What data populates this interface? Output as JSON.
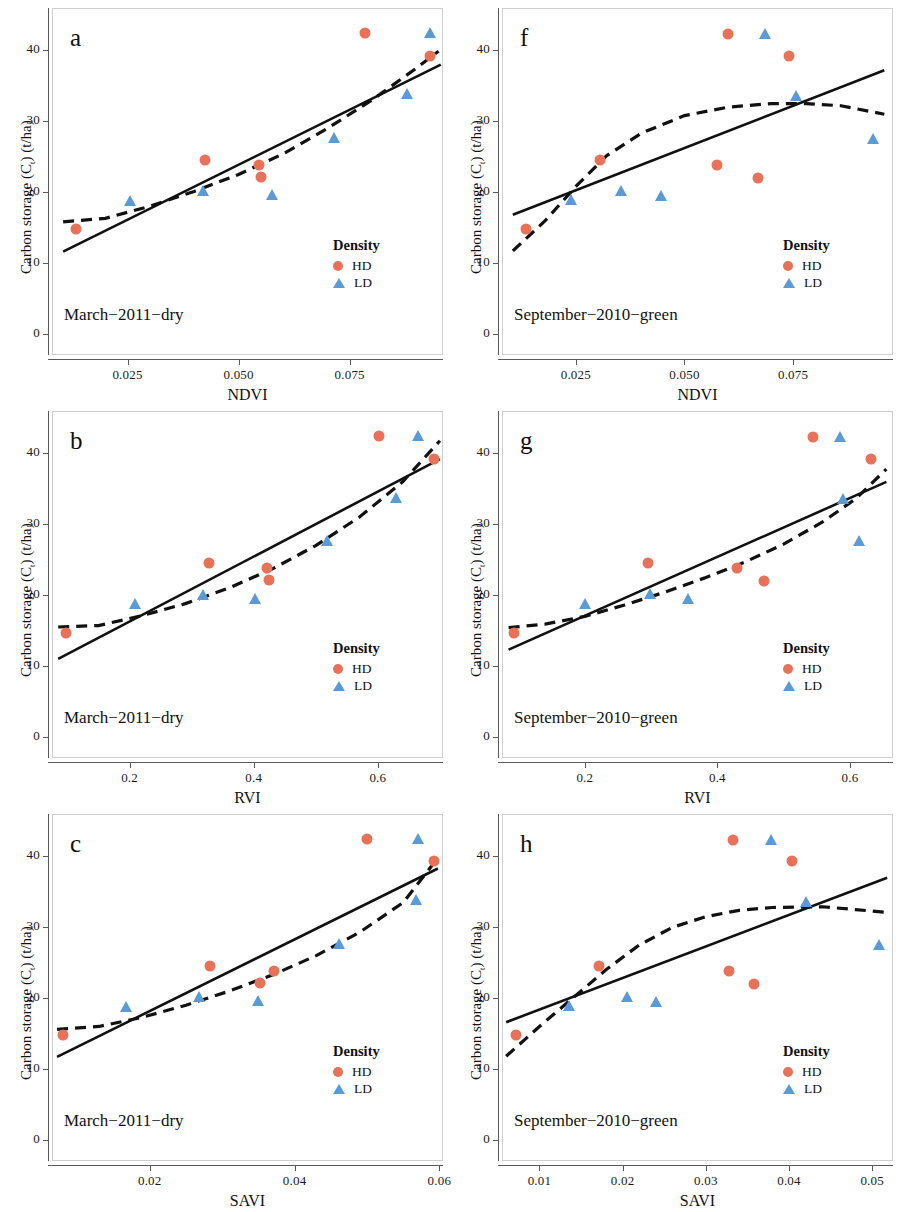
{
  "figure": {
    "y_axis_title": "Carbon storage (Cₜ) (t/ha)",
    "legend_title": "Density",
    "legend_entries": [
      {
        "key": "HD",
        "label": "HD",
        "marker": "circle",
        "color": "#E8715A"
      },
      {
        "key": "LD",
        "label": "LD",
        "marker": "triangle",
        "color": "#5B9BD5"
      }
    ],
    "colors": {
      "hd_marker": "#E8715A",
      "ld_marker": "#5B9BD5",
      "linear_fit": "#111111",
      "poly_fit": "#111111",
      "frame": "#cfcfcf",
      "axis": "#5a5a5a",
      "background": "#ffffff"
    },
    "fit_styles": {
      "linear": "solid",
      "polynomial": "dashed"
    }
  },
  "chart_data": [
    {
      "panel": "a",
      "type": "scatter",
      "title": "",
      "subtitle": "March−2011−dry",
      "xlabel": "NDVI",
      "ylabel": "Carbon storage (Cₜ) (t/ha)",
      "xlim": [
        0.008,
        0.096
      ],
      "ylim": [
        -3,
        46
      ],
      "xticks": [
        0.025,
        0.05,
        0.075
      ],
      "xtick_labels": [
        "0.025",
        "0.050",
        "0.075"
      ],
      "yticks": [
        0,
        10,
        20,
        30,
        40
      ],
      "ytick_labels": [
        "0",
        "10",
        "20",
        "30",
        "40"
      ],
      "grid": false,
      "legend_position": "bottom-right",
      "series": [
        {
          "name": "HD",
          "marker": "circle",
          "color": "#E8715A",
          "points": [
            [
              0.0135,
              14.8
            ],
            [
              0.0425,
              24.6
            ],
            [
              0.0545,
              23.9
            ],
            [
              0.055,
              22.1
            ],
            [
              0.0785,
              42.4
            ],
            [
              0.093,
              39.2
            ]
          ]
        },
        {
          "name": "LD",
          "marker": "triangle",
          "color": "#5B9BD5",
          "points": [
            [
              0.0255,
              18.1
            ],
            [
              0.042,
              19.4
            ],
            [
              0.0575,
              18.9
            ],
            [
              0.0715,
              26.9
            ],
            [
              0.088,
              33.1
            ],
            [
              0.093,
              41.7
            ]
          ]
        }
      ],
      "fits": [
        {
          "name": "linear",
          "style": "solid",
          "points": [
            [
              0.0105,
              11.6
            ],
            [
              0.0955,
              38.0
            ]
          ]
        },
        {
          "name": "polynomial",
          "style": "dashed",
          "points": [
            [
              0.0105,
              15.8
            ],
            [
              0.02,
              16.3
            ],
            [
              0.03,
              18.0
            ],
            [
              0.04,
              20.1
            ],
            [
              0.05,
              22.5
            ],
            [
              0.06,
              25.4
            ],
            [
              0.07,
              29.0
            ],
            [
              0.08,
              33.0
            ],
            [
              0.09,
              37.5
            ],
            [
              0.095,
              39.9
            ]
          ]
        }
      ]
    },
    {
      "panel": "f",
      "type": "scatter",
      "title": "",
      "subtitle": "September−2010−green",
      "xlabel": "NDVI",
      "ylabel": "Carbon storage (Cₜ) (t/ha)",
      "xlim": [
        0.008,
        0.098
      ],
      "ylim": [
        -3,
        46
      ],
      "xticks": [
        0.025,
        0.05,
        0.075
      ],
      "xtick_labels": [
        "0.025",
        "0.050",
        "0.075"
      ],
      "yticks": [
        0,
        10,
        20,
        30,
        40
      ],
      "ytick_labels": [
        "0",
        "10",
        "20",
        "30",
        "40"
      ],
      "grid": false,
      "legend_position": "bottom-right",
      "series": [
        {
          "name": "HD",
          "marker": "circle",
          "color": "#E8715A",
          "points": [
            [
              0.0135,
              14.8
            ],
            [
              0.0305,
              24.5
            ],
            [
              0.0575,
              23.8
            ],
            [
              0.06,
              42.3
            ],
            [
              0.067,
              22.0
            ],
            [
              0.074,
              39.2
            ]
          ]
        },
        {
          "name": "LD",
          "marker": "triangle",
          "color": "#5B9BD5",
          "points": [
            [
              0.0238,
              18.2
            ],
            [
              0.0355,
              19.4
            ],
            [
              0.0445,
              18.8
            ],
            [
              0.0685,
              41.6
            ],
            [
              0.0757,
              32.8
            ],
            [
              0.0935,
              26.8
            ]
          ]
        }
      ],
      "fits": [
        {
          "name": "linear",
          "style": "solid",
          "points": [
            [
              0.0105,
              16.8
            ],
            [
              0.096,
              37.2
            ]
          ]
        },
        {
          "name": "polynomial",
          "style": "dashed",
          "points": [
            [
              0.0105,
              11.7
            ],
            [
              0.018,
              16.0
            ],
            [
              0.025,
              20.8
            ],
            [
              0.032,
              25.1
            ],
            [
              0.04,
              28.3
            ],
            [
              0.05,
              30.8
            ],
            [
              0.06,
              32.0
            ],
            [
              0.07,
              32.5
            ],
            [
              0.078,
              32.5
            ],
            [
              0.086,
              32.2
            ],
            [
              0.096,
              31.0
            ]
          ]
        }
      ]
    },
    {
      "panel": "b",
      "type": "scatter",
      "title": "",
      "subtitle": "March−2011−dry",
      "xlabel": "RVI",
      "ylabel": "Carbon storage (Cₜ) (t/ha)",
      "xlim": [
        0.075,
        0.705
      ],
      "ylim": [
        -3,
        46
      ],
      "xticks": [
        0.2,
        0.4,
        0.6
      ],
      "xtick_labels": [
        "0.2",
        "0.4",
        "0.6"
      ],
      "yticks": [
        0,
        10,
        20,
        30,
        40
      ],
      "ytick_labels": [
        "0",
        "10",
        "20",
        "30",
        "40"
      ],
      "grid": false,
      "legend_position": "bottom-right",
      "series": [
        {
          "name": "HD",
          "marker": "circle",
          "color": "#E8715A",
          "points": [
            [
              0.098,
              14.7
            ],
            [
              0.328,
              24.6
            ],
            [
              0.422,
              23.9
            ],
            [
              0.425,
              22.1
            ],
            [
              0.602,
              42.4
            ],
            [
              0.69,
              39.2
            ]
          ]
        },
        {
          "name": "LD",
          "marker": "triangle",
          "color": "#5B9BD5",
          "points": [
            [
              0.208,
              18.1
            ],
            [
              0.318,
              19.3
            ],
            [
              0.402,
              18.8
            ],
            [
              0.518,
              26.9
            ],
            [
              0.63,
              33.0
            ],
            [
              0.665,
              41.7
            ]
          ]
        }
      ],
      "fits": [
        {
          "name": "linear",
          "style": "solid",
          "points": [
            [
              0.085,
              11.0
            ],
            [
              0.7,
              39.2
            ]
          ]
        },
        {
          "name": "polynomial",
          "style": "dashed",
          "points": [
            [
              0.085,
              15.5
            ],
            [
              0.15,
              15.7
            ],
            [
              0.22,
              17.1
            ],
            [
              0.29,
              18.8
            ],
            [
              0.36,
              21.0
            ],
            [
              0.43,
              23.7
            ],
            [
              0.5,
              27.0
            ],
            [
              0.57,
              31.0
            ],
            [
              0.64,
              36.0
            ],
            [
              0.7,
              41.8
            ]
          ]
        }
      ]
    },
    {
      "panel": "g",
      "type": "scatter",
      "title": "",
      "subtitle": "September−2010−green",
      "xlabel": "RVI",
      "ylabel": "Carbon storage (Cₜ) (t/ha)",
      "xlim": [
        0.075,
        0.665
      ],
      "ylim": [
        -3,
        46
      ],
      "xticks": [
        0.2,
        0.4,
        0.6
      ],
      "xtick_labels": [
        "0.2",
        "0.4",
        "0.6"
      ],
      "yticks": [
        0,
        10,
        20,
        30,
        40
      ],
      "ytick_labels": [
        "0",
        "10",
        "20",
        "30",
        "40"
      ],
      "grid": false,
      "legend_position": "bottom-right",
      "series": [
        {
          "name": "HD",
          "marker": "circle",
          "color": "#E8715A",
          "points": [
            [
              0.093,
              14.7
            ],
            [
              0.295,
              24.6
            ],
            [
              0.43,
              23.8
            ],
            [
              0.47,
              22.0
            ],
            [
              0.545,
              42.3
            ],
            [
              0.632,
              39.2
            ]
          ]
        },
        {
          "name": "LD",
          "marker": "triangle",
          "color": "#5B9BD5",
          "points": [
            [
              0.2,
              18.1
            ],
            [
              0.298,
              19.4
            ],
            [
              0.355,
              18.8
            ],
            [
              0.585,
              41.6
            ],
            [
              0.59,
              32.9
            ],
            [
              0.613,
              26.9
            ]
          ]
        }
      ],
      "fits": [
        {
          "name": "linear",
          "style": "solid",
          "points": [
            [
              0.085,
              12.3
            ],
            [
              0.655,
              36.0
            ]
          ]
        },
        {
          "name": "polynomial",
          "style": "dashed",
          "points": [
            [
              0.085,
              15.4
            ],
            [
              0.14,
              15.9
            ],
            [
              0.2,
              17.0
            ],
            [
              0.26,
              18.6
            ],
            [
              0.32,
              20.4
            ],
            [
              0.38,
              22.4
            ],
            [
              0.44,
              24.6
            ],
            [
              0.5,
              27.2
            ],
            [
              0.56,
              30.4
            ],
            [
              0.61,
              33.7
            ],
            [
              0.655,
              37.8
            ]
          ]
        }
      ]
    },
    {
      "panel": "c",
      "type": "scatter",
      "title": "",
      "subtitle": "March−2011−dry",
      "xlabel": "SAVI",
      "ylabel": "Carbon storage (Cₜ) (t/ha)",
      "xlim": [
        0.0065,
        0.0605
      ],
      "ylim": [
        -3,
        46
      ],
      "xticks": [
        0.02,
        0.04,
        0.06
      ],
      "xtick_labels": [
        "0.02",
        "0.04",
        "0.06"
      ],
      "yticks": [
        0,
        10,
        20,
        30,
        40
      ],
      "ytick_labels": [
        "0",
        "10",
        "20",
        "30",
        "40"
      ],
      "grid": false,
      "legend_position": "bottom-right",
      "series": [
        {
          "name": "HD",
          "marker": "circle",
          "color": "#E8715A",
          "points": [
            [
              0.008,
              14.8
            ],
            [
              0.0283,
              24.6
            ],
            [
              0.0352,
              22.1
            ],
            [
              0.0372,
              23.9
            ],
            [
              0.05,
              42.4
            ],
            [
              0.0592,
              39.3
            ]
          ]
        },
        {
          "name": "LD",
          "marker": "triangle",
          "color": "#5B9BD5",
          "points": [
            [
              0.0167,
              18.1
            ],
            [
              0.0268,
              19.4
            ],
            [
              0.035,
              18.9
            ],
            [
              0.0462,
              26.9
            ],
            [
              0.0568,
              33.1
            ],
            [
              0.057,
              41.7
            ]
          ]
        }
      ],
      "fits": [
        {
          "name": "linear",
          "style": "solid",
          "points": [
            [
              0.0072,
              11.7
            ],
            [
              0.0598,
              38.3
            ]
          ]
        },
        {
          "name": "polynomial",
          "style": "dashed",
          "points": [
            [
              0.0072,
              15.6
            ],
            [
              0.013,
              16.0
            ],
            [
              0.019,
              17.3
            ],
            [
              0.025,
              19.0
            ],
            [
              0.031,
              21.0
            ],
            [
              0.037,
              23.3
            ],
            [
              0.043,
              26.0
            ],
            [
              0.049,
              29.3
            ],
            [
              0.055,
              33.5
            ],
            [
              0.0598,
              39.8
            ]
          ]
        }
      ]
    },
    {
      "panel": "h",
      "type": "scatter",
      "title": "",
      "subtitle": "September−2010−green",
      "xlabel": "SAVI",
      "ylabel": "Carbon storage (Cₜ) (t/ha)",
      "xlim": [
        0.0055,
        0.0525
      ],
      "ylim": [
        -3,
        46
      ],
      "xticks": [
        0.01,
        0.02,
        0.03,
        0.04,
        0.05
      ],
      "xtick_labels": [
        "0.01",
        "0.02",
        "0.03",
        "0.04",
        "0.05"
      ],
      "yticks": [
        0,
        10,
        20,
        30,
        40
      ],
      "ytick_labels": [
        "0",
        "10",
        "20",
        "30",
        "40"
      ],
      "grid": false,
      "legend_position": "bottom-right",
      "series": [
        {
          "name": "HD",
          "marker": "circle",
          "color": "#E8715A",
          "points": [
            [
              0.0072,
              14.8
            ],
            [
              0.0172,
              24.5
            ],
            [
              0.0328,
              23.8
            ],
            [
              0.0333,
              42.3
            ],
            [
              0.0358,
              22.0
            ],
            [
              0.0403,
              39.3
            ]
          ]
        },
        {
          "name": "LD",
          "marker": "triangle",
          "color": "#5B9BD5",
          "points": [
            [
              0.0135,
              18.2
            ],
            [
              0.0205,
              19.4
            ],
            [
              0.024,
              18.8
            ],
            [
              0.0378,
              41.6
            ],
            [
              0.042,
              32.8
            ],
            [
              0.0508,
              26.8
            ]
          ]
        }
      ],
      "fits": [
        {
          "name": "linear",
          "style": "solid",
          "points": [
            [
              0.006,
              16.6
            ],
            [
              0.0518,
              37.0
            ]
          ]
        },
        {
          "name": "polynomial",
          "style": "dashed",
          "points": [
            [
              0.006,
              11.8
            ],
            [
              0.01,
              16.0
            ],
            [
              0.014,
              20.0
            ],
            [
              0.018,
              24.0
            ],
            [
              0.022,
              27.5
            ],
            [
              0.026,
              30.0
            ],
            [
              0.03,
              31.5
            ],
            [
              0.034,
              32.4
            ],
            [
              0.038,
              32.8
            ],
            [
              0.044,
              32.9
            ],
            [
              0.048,
              32.5
            ],
            [
              0.0518,
              32.1
            ]
          ]
        }
      ]
    }
  ]
}
